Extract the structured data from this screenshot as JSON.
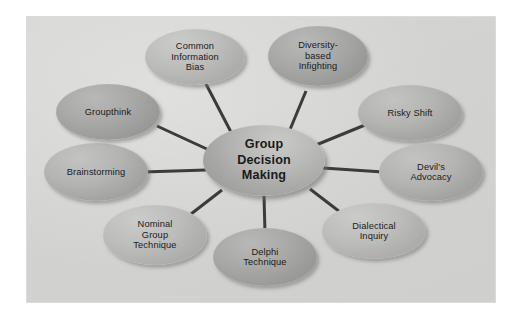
{
  "diagram": {
    "title": "Group Decision Making",
    "type": "hub-and-spoke concept map",
    "panel_background_color": "#d3d4d2",
    "page_background_color": "#ffffff",
    "connector_color": "#3b3b3b",
    "node_fill_color": "#b0b1af",
    "text_color": "#1a1a1a"
  },
  "hub": {
    "label": "Group\nDecision\nMaking",
    "line1": "Group",
    "line2": "Decision",
    "line3": "Making"
  },
  "nodes": [
    {
      "id": "common-information-bias",
      "label": "Common\nInformation\nBias"
    },
    {
      "id": "diversity-based-infighting",
      "label": "Diversity-\nbased\nInfighting"
    },
    {
      "id": "risky-shift",
      "label": "Risky Shift"
    },
    {
      "id": "devils-advocacy",
      "label": "Devil's\nAdvocacy"
    },
    {
      "id": "dialectical-inquiry",
      "label": "Dialectical\nInquiry"
    },
    {
      "id": "delphi-technique",
      "label": "Delphi\nTechnique"
    },
    {
      "id": "nominal-group-technique",
      "label": "Nominal\nGroup\nTechnique"
    },
    {
      "id": "brainstorming",
      "label": "Brainstorming"
    },
    {
      "id": "groupthink",
      "label": "Groupthink"
    }
  ]
}
